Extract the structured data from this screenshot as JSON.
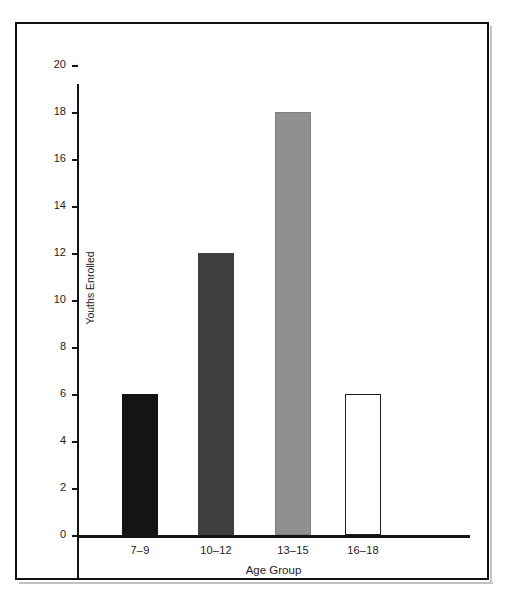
{
  "figure": {
    "background_color": "#ffffff",
    "frame_color": "#111111"
  },
  "chart_data": {
    "type": "bar",
    "title": "",
    "subtitle": "",
    "xlabel": "Age Group",
    "ylabel": "Youths Enrolled",
    "categories": [
      "7–9",
      "10–12",
      "13–15",
      "16–18"
    ],
    "values": [
      6,
      12,
      18,
      6
    ],
    "ylim": [
      0,
      21
    ],
    "y_ticks": [
      0,
      2,
      4,
      6,
      8,
      10,
      12,
      14,
      16,
      18,
      20
    ],
    "y_tick_labels": [
      "0",
      "2",
      "4",
      "6",
      "8",
      "10",
      "12",
      "14",
      "16",
      "18",
      "20"
    ],
    "grid": false,
    "legend": false,
    "legend_position": "none",
    "bar_colors": [
      "#141414",
      "#3f3f3f",
      "#909090",
      "#ffffff"
    ],
    "bar_edge_colors": [
      "#141414",
      "#3f3f3f",
      "#808080",
      "#1f1f1f"
    ],
    "bars": [
      {
        "category": "7–9",
        "value": 6,
        "fill": "#141414",
        "style": "solid-black"
      },
      {
        "category": "10–12",
        "value": 12,
        "fill": "#3f3f3f",
        "style": "solid-dark-gray"
      },
      {
        "category": "13–15",
        "value": 18,
        "fill": "#909090",
        "style": "solid-light-gray"
      },
      {
        "category": "16–18",
        "value": 6,
        "fill": "#ffffff",
        "style": "outlined-white"
      }
    ]
  }
}
